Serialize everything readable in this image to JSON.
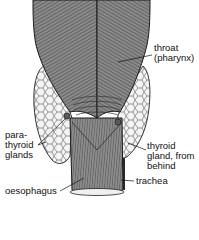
{
  "diagram": {
    "labels": {
      "throat": {
        "line1": "throat",
        "line2": "(pharynx)"
      },
      "parathyroid": {
        "line1": "para-",
        "line2": "thyroid",
        "line3": "glands"
      },
      "thyroid": {
        "line1": "thyroid",
        "line2": "gland, from",
        "line3": "behind"
      },
      "trachea": {
        "line1": "trachea"
      },
      "oesophagus": {
        "line1": "oesophagus"
      }
    },
    "colors": {
      "ink": "#111111",
      "muscle": "#7a7a7a",
      "muscle_dark": "#3a3a3a",
      "gland_fill": "#f2f2f2",
      "background": "#ffffff"
    }
  }
}
